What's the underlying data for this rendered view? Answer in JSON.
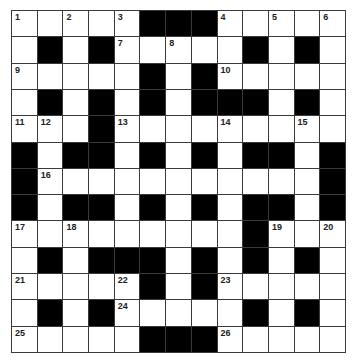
{
  "puzzle": {
    "rows": 13,
    "cols": 13,
    "colors": {
      "block": "#000000",
      "cell": "#ffffff",
      "grid_line": "#3a3a3a",
      "number": "#222222"
    },
    "grid": [
      "#####...#####",
      "#.#.#####.#.#",
      "#####.#.#####",
      "#.#.#.#...#.#",
      "###.#########",
      ".#..#.#.#..#.",
      ".###########.",
      ".#..#.#.#..#.",
      "#########.###",
      "#.#...#.#.#.#",
      "#####.#.#####",
      "#.#.#####.#.#",
      "#####...#####"
    ],
    "numbers": [
      {
        "row": 0,
        "col": 0,
        "n": "1"
      },
      {
        "row": 0,
        "col": 2,
        "n": "2"
      },
      {
        "row": 0,
        "col": 4,
        "n": "3"
      },
      {
        "row": 0,
        "col": 8,
        "n": "4"
      },
      {
        "row": 0,
        "col": 10,
        "n": "5"
      },
      {
        "row": 0,
        "col": 12,
        "n": "6"
      },
      {
        "row": 1,
        "col": 4,
        "n": "7"
      },
      {
        "row": 1,
        "col": 6,
        "n": "8"
      },
      {
        "row": 2,
        "col": 0,
        "n": "9"
      },
      {
        "row": 2,
        "col": 8,
        "n": "10"
      },
      {
        "row": 4,
        "col": 0,
        "n": "11"
      },
      {
        "row": 4,
        "col": 1,
        "n": "12"
      },
      {
        "row": 4,
        "col": 4,
        "n": "13"
      },
      {
        "row": 4,
        "col": 8,
        "n": "14"
      },
      {
        "row": 4,
        "col": 11,
        "n": "15"
      },
      {
        "row": 6,
        "col": 1,
        "n": "16"
      },
      {
        "row": 8,
        "col": 0,
        "n": "17"
      },
      {
        "row": 8,
        "col": 2,
        "n": "18"
      },
      {
        "row": 8,
        "col": 10,
        "n": "19"
      },
      {
        "row": 8,
        "col": 12,
        "n": "20"
      },
      {
        "row": 10,
        "col": 0,
        "n": "21"
      },
      {
        "row": 10,
        "col": 4,
        "n": "22"
      },
      {
        "row": 10,
        "col": 8,
        "n": "23"
      },
      {
        "row": 11,
        "col": 4,
        "n": "24"
      },
      {
        "row": 12,
        "col": 0,
        "n": "25"
      },
      {
        "row": 12,
        "col": 8,
        "n": "26"
      }
    ]
  }
}
